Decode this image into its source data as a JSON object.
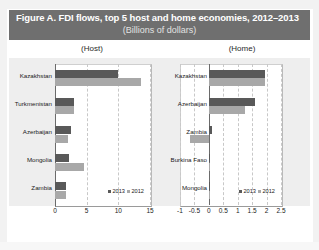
{
  "figure": {
    "title": "Figure A. FDI flows, top 5 host and home economies, 2012–2013",
    "subtitle": "(Billions of dollars)",
    "panel_host_caption": "(Host)",
    "panel_home_caption": "(Home)"
  },
  "legend": {
    "series_2013": "2013",
    "series_2012": "2012"
  },
  "colors": {
    "series_2013": "#595959",
    "series_2012": "#a8a8a8",
    "title_band": "#6f6f6f",
    "panel_background": "#eeeeee"
  },
  "chart_data": [
    {
      "type": "bar",
      "title": "(Host)",
      "orientation": "horizontal",
      "categories": [
        "Kazakhstan",
        "Turkmenistan",
        "Azerbaijan",
        "Mongolia",
        "Zambia"
      ],
      "series": [
        {
          "name": "2013",
          "values": [
            10.0,
            3.0,
            2.6,
            2.2,
            1.8
          ]
        },
        {
          "name": "2012",
          "values": [
            13.6,
            3.0,
            2.1,
            4.5,
            1.7
          ]
        }
      ],
      "xlabel": "",
      "ylabel": "",
      "xlim": [
        0,
        15
      ],
      "xticks": [
        0,
        5,
        10,
        15
      ],
      "xticklabels": [
        "0",
        "5",
        "10",
        "15"
      ],
      "grid": true,
      "legend_position": "bottom-right"
    },
    {
      "type": "bar",
      "title": "(Home)",
      "orientation": "horizontal",
      "categories": [
        "Kazakhstan",
        "Azerbaijan",
        "Zambia",
        "Burkina Faso",
        "Mongolia"
      ],
      "series": [
        {
          "name": "2013",
          "values": [
            1.95,
            1.6,
            0.1,
            0.05,
            0.04
          ]
        },
        {
          "name": "2012",
          "values": [
            1.95,
            1.25,
            -0.65,
            0.02,
            0.02
          ]
        }
      ],
      "xlabel": "",
      "ylabel": "",
      "xlim": [
        -1,
        2.5
      ],
      "xticks": [
        -1,
        -0.5,
        0,
        0.5,
        1,
        1.5,
        2,
        2.5
      ],
      "xticklabels": [
        "-1",
        "-0.5",
        "0",
        "0.5",
        "1",
        "1.5",
        "2",
        "2.5"
      ],
      "grid": true,
      "legend_position": "bottom-right"
    }
  ]
}
